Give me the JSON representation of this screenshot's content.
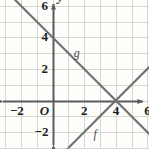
{
  "chart_data": {
    "type": "line",
    "title": "",
    "subtitle": "",
    "xlabel": "x",
    "ylabel": "y",
    "xlim": [
      -3,
      7
    ],
    "ylim": [
      -3,
      7
    ],
    "grid": true,
    "grid_step": 1,
    "legend_position": "inline-curve-labels",
    "origin_label": "O",
    "x_ticks": [
      -2,
      2,
      4,
      6
    ],
    "x_tick_labels": [
      "−2",
      "2",
      "4",
      "6"
    ],
    "y_ticks": [
      -2,
      2,
      4,
      6
    ],
    "y_tick_labels": [
      "−2",
      "2",
      "4",
      "6"
    ],
    "series": [
      {
        "name": "g",
        "label": "g",
        "slope": -1,
        "intercept": 4,
        "equation": "y = -x + 4",
        "color": "#6f6f6f",
        "x": [
          -3,
          7
        ],
        "values": [
          7,
          -3
        ],
        "points": [
          [
            0,
            4
          ],
          [
            4,
            0
          ]
        ],
        "arrows": [
          "start",
          "end"
        ],
        "label_point": [
          1.35,
          3.4
        ]
      },
      {
        "name": "f",
        "label": "f",
        "slope": 1,
        "intercept": -4,
        "equation": "y = x - 4",
        "color": "#6f6f6f",
        "x": [
          1,
          7
        ],
        "values": [
          -3,
          3
        ],
        "points": [
          [
            4,
            0
          ],
          [
            6,
            2
          ]
        ],
        "arrows": [
          "start",
          "end"
        ],
        "label_point": [
          2.6,
          -1.75
        ]
      }
    ],
    "intersection": [
      4,
      0
    ],
    "colors": {
      "background": "#fdfdfb",
      "grid": "#d8d8d2",
      "axis": "#5a5a5a",
      "curve": "#6f6f6f",
      "text": "#1d1d1d"
    }
  }
}
